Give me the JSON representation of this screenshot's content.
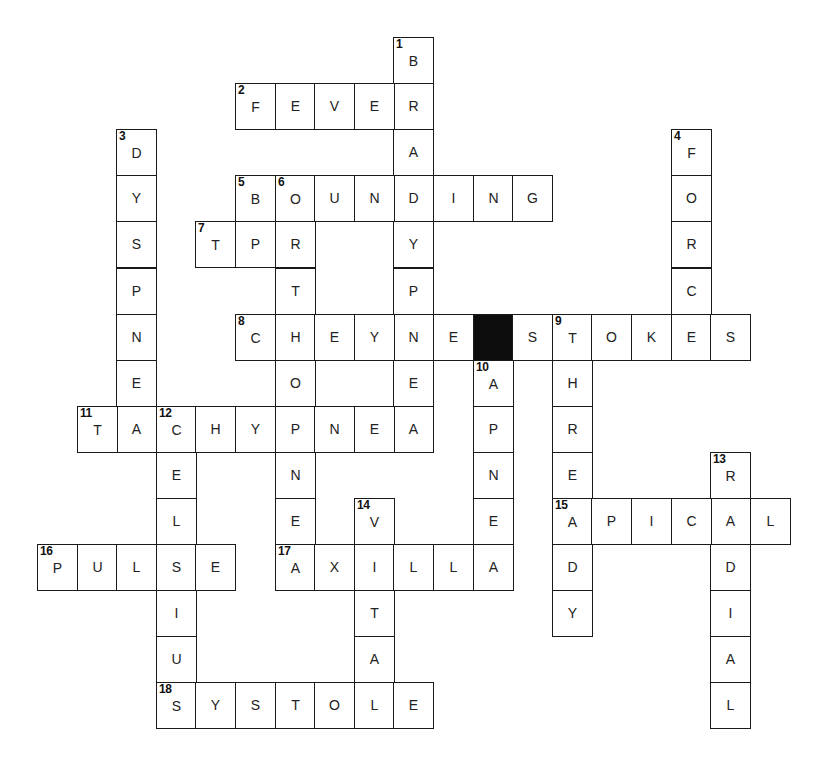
{
  "puzzle": {
    "grid": {
      "origin_x": 37,
      "origin_y": 37,
      "col_pitch": 39.6,
      "row_pitch": 46.1
    },
    "colors": {
      "line": "#1a1a1a",
      "block": "#0d0d0d",
      "background": "#ffffff"
    },
    "entries": [
      {
        "number": "1",
        "direction": "down",
        "answer": "BRADYPNEA",
        "row": 0,
        "col": 9
      },
      {
        "number": "2",
        "direction": "across",
        "answer": "FEVER",
        "row": 1,
        "col": 5
      },
      {
        "number": "3",
        "direction": "down",
        "answer": "DYSPNEA",
        "row": 2,
        "col": 2
      },
      {
        "number": "4",
        "direction": "down",
        "answer": "FORCE",
        "row": 2,
        "col": 16
      },
      {
        "number": "5",
        "direction": "across",
        "answer": "BOUNDING",
        "row": 3,
        "col": 5
      },
      {
        "number": "6",
        "direction": "down",
        "answer": "ORTHOPNEA",
        "row": 3,
        "col": 6
      },
      {
        "number": "7",
        "direction": "across",
        "answer": "TPR",
        "row": 4,
        "col": 4
      },
      {
        "number": "8",
        "direction": "across",
        "answer": "CHEYNE#STOKES",
        "row": 6,
        "col": 5
      },
      {
        "number": "9",
        "direction": "down",
        "answer": "THREADY",
        "row": 6,
        "col": 13
      },
      {
        "number": "10",
        "direction": "down",
        "answer": "APNEA",
        "row": 7,
        "col": 11
      },
      {
        "number": "11",
        "direction": "across",
        "answer": "TACHYPNEA",
        "row": 8,
        "col": 1
      },
      {
        "number": "12",
        "direction": "down",
        "answer": "CELSIUS",
        "row": 8,
        "col": 3
      },
      {
        "number": "13",
        "direction": "down",
        "answer": "RADIAL",
        "row": 9,
        "col": 17
      },
      {
        "number": "14",
        "direction": "down",
        "answer": "VITAL",
        "row": 10,
        "col": 8
      },
      {
        "number": "15",
        "direction": "across",
        "answer": "APICAL",
        "row": 10,
        "col": 13
      },
      {
        "number": "16",
        "direction": "across",
        "answer": "PULSE",
        "row": 11,
        "col": 0
      },
      {
        "number": "17",
        "direction": "across",
        "answer": "AXILLA",
        "row": 11,
        "col": 6
      },
      {
        "number": "18",
        "direction": "across",
        "answer": "SYSTOLE",
        "row": 14,
        "col": 3
      }
    ]
  }
}
